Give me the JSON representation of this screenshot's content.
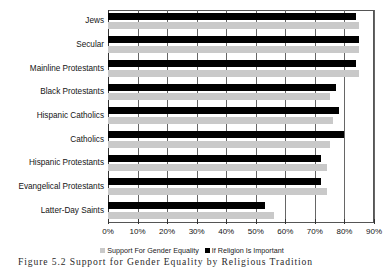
{
  "figure": {
    "caption": "Figure 5.2   Support for Gender Equality by Religious Tradition"
  },
  "legend": {
    "position": "bottom-center",
    "items": [
      {
        "label": "Support For Gender Equality",
        "color": "#c9c9c9",
        "swatch": "light-gray-square"
      },
      {
        "label": "If Religion Is Important",
        "color": "#000000",
        "swatch": "black-square"
      }
    ]
  },
  "axis": {
    "x_ticks": [
      "0%",
      "10%",
      "20%",
      "30%",
      "40%",
      "50%",
      "60%",
      "70%",
      "80%",
      "90%"
    ],
    "x_min": 0,
    "x_max": 90
  },
  "chart_data": {
    "type": "bar",
    "orientation": "horizontal",
    "title": "",
    "xlabel": "",
    "ylabel": "",
    "xlim": [
      0,
      90
    ],
    "grid": true,
    "legend_position": "bottom",
    "categories": [
      "Jews",
      "Secular",
      "Mainline Protestants",
      "Black Protestants",
      "Hispanic Catholics",
      "Catholics",
      "Hispanic Protestants",
      "Evangelical Protestants",
      "Latter-Day Saints"
    ],
    "series": [
      {
        "name": "If Religion Is Important",
        "color": "#000000",
        "values": [
          84,
          85,
          84,
          77,
          78,
          80,
          72,
          72,
          53
        ]
      },
      {
        "name": "Support For Gender Equality",
        "color": "#c9c9c9",
        "values": [
          85,
          85,
          85,
          75,
          76,
          75,
          74,
          74,
          56
        ]
      }
    ]
  }
}
